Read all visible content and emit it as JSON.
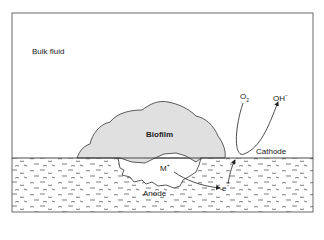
{
  "labels": {
    "bulk_fluid": "Bulk fluid",
    "biofilm": "Biofilm",
    "cathode": "Cathode",
    "anode": "Anode",
    "oxygen": "O",
    "oxygen_sub": "2",
    "hydroxide": "OH",
    "hydroxide_sup": "−",
    "metal_ion": "M",
    "metal_ion_sup": "+",
    "electron": "e",
    "electron_sup": "−"
  },
  "colors": {
    "biofilm_fill": "#e0e0e0",
    "stroke": "#333333",
    "background": "#ffffff"
  }
}
